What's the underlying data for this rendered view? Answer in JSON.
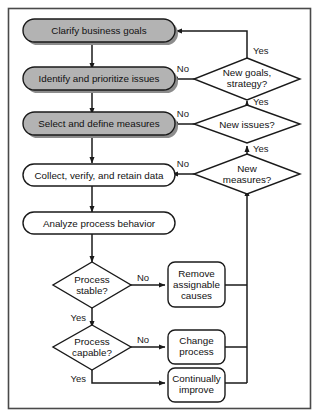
{
  "diagram": {
    "frame": {
      "border_color": "#4a4a4a",
      "background": "#ffffff"
    },
    "colors": {
      "process_fill": "#b3b3b3",
      "plain_fill": "#ffffff",
      "stroke": "#1a1a1a",
      "shadow": "#8c8c8c",
      "text": "#111111"
    },
    "process_nodes": [
      {
        "id": "clarify",
        "label": "Clarify business goals",
        "shape": "rounded-rect",
        "fill": "gray"
      },
      {
        "id": "identify",
        "label": "Identify and prioritize issues",
        "shape": "rounded-rect",
        "fill": "gray"
      },
      {
        "id": "select",
        "label": "Select and define measures",
        "shape": "rounded-rect",
        "fill": "gray"
      },
      {
        "id": "collect",
        "label": "Collect, verify, and retain data",
        "shape": "rounded-rect",
        "fill": "white"
      },
      {
        "id": "analyze",
        "label": "Analyze process behavior",
        "shape": "rounded-rect",
        "fill": "white"
      }
    ],
    "decision_nodes": [
      {
        "id": "new-goals",
        "line1": "New goals,",
        "line2": "strategy?"
      },
      {
        "id": "new-issues",
        "line1": "New issues?",
        "line2": ""
      },
      {
        "id": "new-measures",
        "line1": "New",
        "line2": "measures?"
      },
      {
        "id": "process-stable",
        "line1": "Process",
        "line2": "stable?"
      },
      {
        "id": "process-capable",
        "line1": "Process",
        "line2": "capable?"
      }
    ],
    "action_nodes": [
      {
        "id": "remove-causes",
        "line1": "Remove",
        "line2": "assignable",
        "line3": "causes"
      },
      {
        "id": "change-process",
        "line1": "Change",
        "line2": "process",
        "line3": ""
      },
      {
        "id": "continually-improve",
        "line1": "Continually",
        "line2": "improve",
        "line3": ""
      }
    ],
    "edge_labels": [
      {
        "id": "goals-yes",
        "text": "Yes"
      },
      {
        "id": "goals-no",
        "text": "No"
      },
      {
        "id": "issues-yes",
        "text": "Yes"
      },
      {
        "id": "issues-no",
        "text": "No"
      },
      {
        "id": "measures-yes",
        "text": "Yes"
      },
      {
        "id": "measures-no",
        "text": "No"
      },
      {
        "id": "stable-no",
        "text": "No"
      },
      {
        "id": "stable-yes",
        "text": "Yes"
      },
      {
        "id": "capable-no",
        "text": "No"
      },
      {
        "id": "capable-yes",
        "text": "Yes"
      }
    ]
  }
}
